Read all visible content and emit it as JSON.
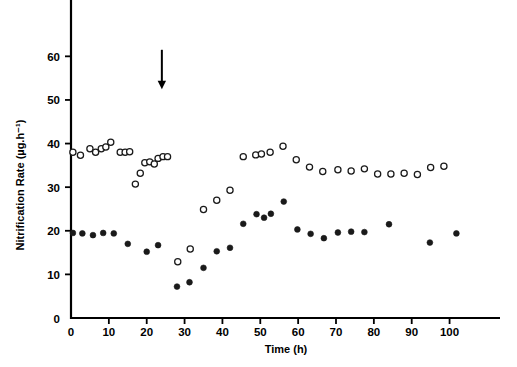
{
  "chart_data": {
    "type": "scatter",
    "title": "",
    "xlabel": "Time (h)",
    "ylabel": "Nitrification Rate (µg.h⁻¹)",
    "xlim": [
      0,
      112
    ],
    "ylim": [
      0,
      72
    ],
    "xticks": [
      0,
      10,
      20,
      30,
      40,
      50,
      60,
      70,
      80,
      90,
      100
    ],
    "xtick_labels": [
      "0",
      "10",
      "20",
      "30",
      "40",
      "50",
      "60",
      "70",
      "80",
      "90",
      "100"
    ],
    "yticks": [
      0,
      10,
      20,
      30,
      40,
      50,
      60
    ],
    "ytick_labels": [
      "0",
      "10",
      "20",
      "30",
      "40",
      "50",
      "60"
    ],
    "grid": false,
    "legend": "none",
    "annotations": [
      {
        "name": "treatment-arrow",
        "kind": "down-arrow",
        "x": 24,
        "y_from": 61.5,
        "y_to": 53.5,
        "label": ""
      }
    ],
    "series": [
      {
        "name": "Open circles",
        "marker": "open-circle",
        "color": "#1a1a1a",
        "points": [
          {
            "x": 0.5,
            "y": 38.0
          },
          {
            "x": 2.5,
            "y": 37.3
          },
          {
            "x": 5.0,
            "y": 38.8
          },
          {
            "x": 6.5,
            "y": 38.0
          },
          {
            "x": 8.0,
            "y": 38.8
          },
          {
            "x": 9.2,
            "y": 39.2
          },
          {
            "x": 10.5,
            "y": 40.3
          },
          {
            "x": 13.0,
            "y": 38.0
          },
          {
            "x": 14.3,
            "y": 38.0
          },
          {
            "x": 15.5,
            "y": 38.1
          },
          {
            "x": 17.0,
            "y": 30.7
          },
          {
            "x": 18.3,
            "y": 33.2
          },
          {
            "x": 19.5,
            "y": 35.6
          },
          {
            "x": 20.8,
            "y": 35.8
          },
          {
            "x": 22.0,
            "y": 35.3
          },
          {
            "x": 23.0,
            "y": 36.6
          },
          {
            "x": 24.3,
            "y": 37.0
          },
          {
            "x": 25.5,
            "y": 37.0
          },
          {
            "x": 28.2,
            "y": 12.9
          },
          {
            "x": 31.5,
            "y": 15.8
          },
          {
            "x": 35.0,
            "y": 24.9
          },
          {
            "x": 38.5,
            "y": 27.0
          },
          {
            "x": 42.0,
            "y": 29.3
          },
          {
            "x": 45.5,
            "y": 37.0
          },
          {
            "x": 48.8,
            "y": 37.4
          },
          {
            "x": 50.3,
            "y": 37.6
          },
          {
            "x": 52.6,
            "y": 38.0
          },
          {
            "x": 56.0,
            "y": 39.4
          },
          {
            "x": 59.5,
            "y": 36.3
          },
          {
            "x": 63.0,
            "y": 34.6
          },
          {
            "x": 66.5,
            "y": 33.6
          },
          {
            "x": 70.5,
            "y": 34.0
          },
          {
            "x": 74.0,
            "y": 33.7
          },
          {
            "x": 77.5,
            "y": 34.2
          },
          {
            "x": 81.0,
            "y": 33.0
          },
          {
            "x": 84.5,
            "y": 33.0
          },
          {
            "x": 88.0,
            "y": 33.2
          },
          {
            "x": 91.5,
            "y": 32.9
          },
          {
            "x": 95.0,
            "y": 34.5
          },
          {
            "x": 98.5,
            "y": 34.8
          }
        ]
      },
      {
        "name": "Filled circles",
        "marker": "filled-circle",
        "color": "#1a1a1a",
        "points": [
          {
            "x": 0.5,
            "y": 19.5
          },
          {
            "x": 3.0,
            "y": 19.4
          },
          {
            "x": 5.8,
            "y": 19.0
          },
          {
            "x": 8.5,
            "y": 19.5
          },
          {
            "x": 11.3,
            "y": 19.4
          },
          {
            "x": 15.0,
            "y": 17.0
          },
          {
            "x": 20.0,
            "y": 15.2
          },
          {
            "x": 23.0,
            "y": 16.7
          },
          {
            "x": 28.0,
            "y": 7.2
          },
          {
            "x": 31.3,
            "y": 8.2
          },
          {
            "x": 35.0,
            "y": 11.5
          },
          {
            "x": 38.5,
            "y": 15.3
          },
          {
            "x": 42.0,
            "y": 16.1
          },
          {
            "x": 45.5,
            "y": 21.6
          },
          {
            "x": 49.0,
            "y": 23.8
          },
          {
            "x": 51.0,
            "y": 23.0
          },
          {
            "x": 52.8,
            "y": 23.9
          },
          {
            "x": 56.2,
            "y": 26.7
          },
          {
            "x": 59.8,
            "y": 20.3
          },
          {
            "x": 63.3,
            "y": 19.3
          },
          {
            "x": 66.8,
            "y": 18.3
          },
          {
            "x": 70.5,
            "y": 19.6
          },
          {
            "x": 74.0,
            "y": 19.8
          },
          {
            "x": 77.5,
            "y": 19.7
          },
          {
            "x": 84.0,
            "y": 21.5
          },
          {
            "x": 94.8,
            "y": 17.3
          },
          {
            "x": 101.8,
            "y": 19.4
          }
        ]
      }
    ]
  }
}
